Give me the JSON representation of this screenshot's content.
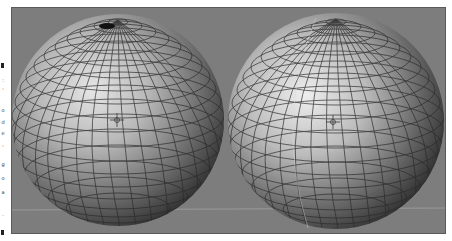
{
  "viewport": {
    "name": "3D viewport",
    "background_color": "#7d7d7d",
    "grid_line_color": "#9a9a9a"
  },
  "objects": [
    {
      "name": "left-sphere",
      "type": "UV sphere",
      "shading": "smooth",
      "pole": "pinched",
      "has_3d_cursor": true
    },
    {
      "name": "right-sphere",
      "type": "UV sphere",
      "shading": "smooth",
      "pole": "even",
      "has_3d_cursor": true
    }
  ],
  "gutter": {
    "glyphs": [
      ":",
      "'",
      "o",
      "d",
      "e",
      "'",
      "g",
      "o",
      "a",
      "."
    ]
  }
}
